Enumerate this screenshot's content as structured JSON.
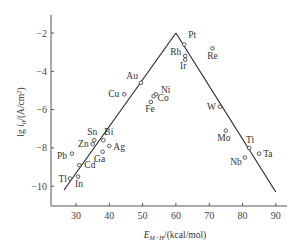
{
  "chart_data": {
    "type": "scatter",
    "title": "",
    "xlabel": "E_M−H/(kcal/mol)",
    "xlabel_main": "E",
    "xlabel_sub": "M−H",
    "xlabel_unit": "/(kcal/mol)",
    "ylabel": "lg i0/(A/cm²)",
    "xlim": [
      23,
      94
    ],
    "ylim": [
      -11,
      0.9
    ],
    "xticks": [
      30,
      40,
      50,
      60,
      70,
      80,
      90
    ],
    "yticks": [
      -2,
      -4,
      -6,
      -8,
      -10
    ],
    "grid": false,
    "legend": "none",
    "points": [
      {
        "label": "Pt",
        "x": 62.5,
        "y": -2.6
      },
      {
        "label": "Rh",
        "x": 62.8,
        "y": -3.2
      },
      {
        "label": "Ir",
        "x": 62.8,
        "y": -3.4
      },
      {
        "label": "Re",
        "x": 71.0,
        "y": -2.8
      },
      {
        "label": "Au",
        "x": 49.5,
        "y": -4.6
      },
      {
        "label": "Ni",
        "x": 54.0,
        "y": -5.2
      },
      {
        "label": "Co",
        "x": 53.3,
        "y": -5.3
      },
      {
        "label": "Cu",
        "x": 44.5,
        "y": -5.2
      },
      {
        "label": "Fe",
        "x": 52.5,
        "y": -5.6
      },
      {
        "label": "W",
        "x": 73.2,
        "y": -5.85
      },
      {
        "label": "Mo",
        "x": 75.0,
        "y": -7.1
      },
      {
        "label": "Ti",
        "x": 82.0,
        "y": -8.0
      },
      {
        "label": "Ta",
        "x": 85.0,
        "y": -8.3
      },
      {
        "label": "Nb",
        "x": 80.7,
        "y": -8.5
      },
      {
        "label": "Sn",
        "x": 35.5,
        "y": -7.6
      },
      {
        "label": "Zn",
        "x": 35.0,
        "y": -7.8
      },
      {
        "label": "Bi",
        "x": 38.2,
        "y": -7.6
      },
      {
        "label": "Ag",
        "x": 40.0,
        "y": -7.9
      },
      {
        "label": "Ga",
        "x": 38.0,
        "y": -8.2
      },
      {
        "label": "Pb",
        "x": 28.8,
        "y": -8.3
      },
      {
        "label": "Cd",
        "x": 31.0,
        "y": -8.9
      },
      {
        "label": "Tl",
        "x": 28.2,
        "y": -9.6
      },
      {
        "label": "In",
        "x": 30.6,
        "y": -9.5
      }
    ],
    "lines": [
      {
        "name": "volcano-left",
        "x": [
          26.4,
          60
        ],
        "y": [
          -10.2,
          -2
        ]
      },
      {
        "name": "volcano-right",
        "x": [
          60,
          90
        ],
        "y": [
          -2,
          -10.3
        ]
      }
    ]
  }
}
